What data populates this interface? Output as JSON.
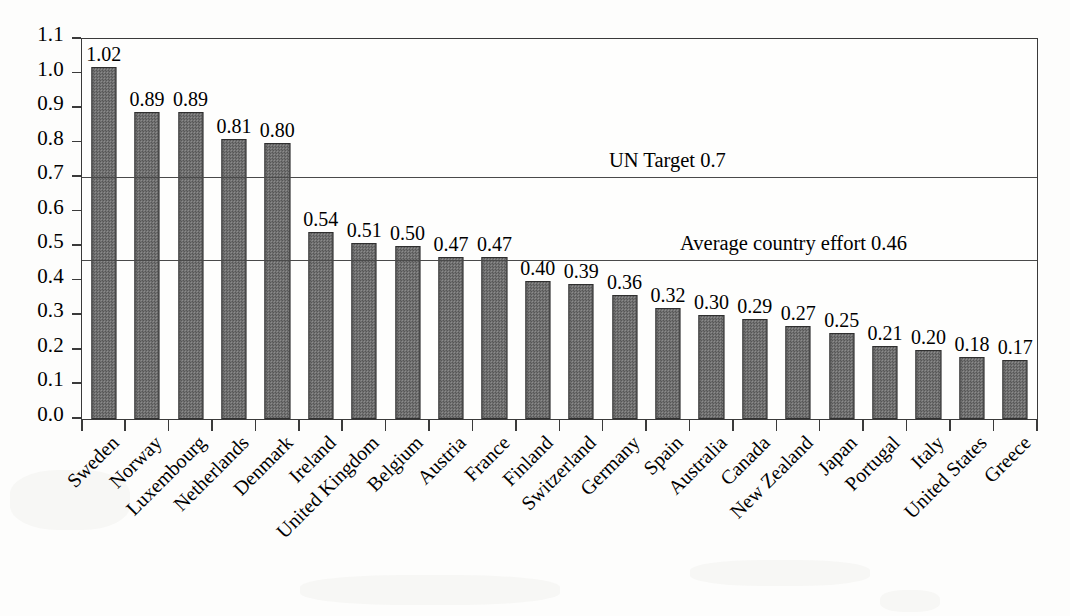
{
  "chart_data": {
    "type": "bar",
    "title": "",
    "subtitle": "",
    "xlabel": "",
    "ylabel": "",
    "ylim": [
      0.0,
      1.1
    ],
    "grid": false,
    "legend": "none",
    "y_ticks": [
      "0.0",
      "0.1",
      "0.2",
      "0.3",
      "0.4",
      "0.5",
      "0.6",
      "0.7",
      "0.8",
      "0.9",
      "1.0",
      "1.1"
    ],
    "y_tick_values": [
      0.0,
      0.1,
      0.2,
      0.3,
      0.4,
      0.5,
      0.6,
      0.7,
      0.8,
      0.9,
      1.0,
      1.1
    ],
    "categories": [
      "Sweden",
      "Norway",
      "Luxembourg",
      "Netherlands",
      "Denmark",
      "Ireland",
      "United Kingdom",
      "Belgium",
      "Austria",
      "France",
      "Finland",
      "Switzerland",
      "Germany",
      "Spain",
      "Australia",
      "Canada",
      "New Zealand",
      "Japan",
      "Portugal",
      "Italy",
      "United States",
      "Greece"
    ],
    "values": [
      1.02,
      0.89,
      0.89,
      0.81,
      0.8,
      0.54,
      0.51,
      0.5,
      0.47,
      0.47,
      0.4,
      0.39,
      0.36,
      0.32,
      0.3,
      0.29,
      0.27,
      0.25,
      0.21,
      0.2,
      0.18,
      0.17
    ],
    "value_labels": [
      "1.02",
      "0.89",
      "0.89",
      "0.81",
      "0.80",
      "0.54",
      "0.51",
      "0.50",
      "0.47",
      "0.47",
      "0.40",
      "0.39",
      "0.36",
      "0.32",
      "0.30",
      "0.29",
      "0.27",
      "0.25",
      "0.21",
      "0.20",
      "0.18",
      "0.17"
    ],
    "bar_color": "#6e6e6e",
    "bar_edge_color": "#2f2f2f",
    "annotations": [
      {
        "text": "UN Target 0.7",
        "value": 0.7,
        "line": true
      },
      {
        "text": "Average country effort 0.46",
        "value": 0.46,
        "line": true
      }
    ]
  }
}
